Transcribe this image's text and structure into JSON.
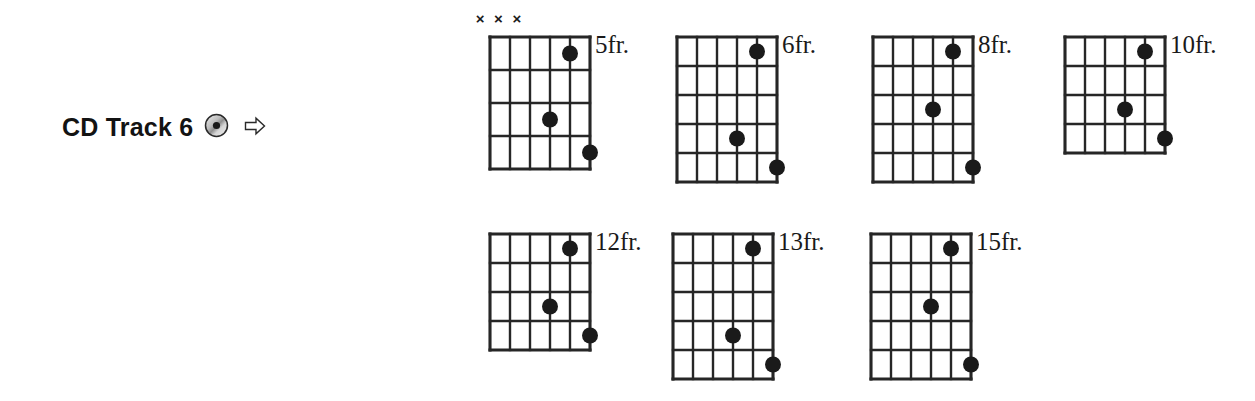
{
  "colors": {
    "ink": "#1a1a1a",
    "grid_line": "#262626",
    "dot": "#1a1a1a",
    "background": "#ffffff"
  },
  "left_block": {
    "label": "CD Track 6",
    "cd_icon_name": "cd-disc-icon",
    "arrow_icon_name": "right-arrow-icon",
    "arrow_glyph": "⇨"
  },
  "chart_data": {
    "type": "table",
    "strings": 6,
    "columns": 5,
    "mute_symbol": "×",
    "diagrams": [
      {
        "id": "chord-5fr",
        "fret_label": "5fr.",
        "frets": 4,
        "x": 481,
        "y": 28,
        "cell_w": 20,
        "cell_h": 33,
        "muted_strings": [
          1,
          2,
          3
        ],
        "dots": [
          {
            "string": 5,
            "fret": 1
          },
          {
            "string": 4,
            "fret": 3
          },
          {
            "string": 6,
            "fret": 4
          }
        ]
      },
      {
        "id": "chord-6fr",
        "fret_label": "6fr.",
        "frets": 5,
        "x": 668,
        "y": 28,
        "cell_w": 20,
        "cell_h": 29,
        "muted_strings": [],
        "dots": [
          {
            "string": 5,
            "fret": 1
          },
          {
            "string": 4,
            "fret": 4
          },
          {
            "string": 6,
            "fret": 5
          }
        ]
      },
      {
        "id": "chord-8fr",
        "fret_label": "8fr.",
        "frets": 5,
        "x": 864,
        "y": 28,
        "cell_w": 20,
        "cell_h": 29,
        "muted_strings": [],
        "dots": [
          {
            "string": 5,
            "fret": 1
          },
          {
            "string": 4,
            "fret": 3
          },
          {
            "string": 6,
            "fret": 5
          }
        ]
      },
      {
        "id": "chord-10fr",
        "fret_label": "10fr.",
        "frets": 4,
        "x": 1056,
        "y": 28,
        "cell_w": 20,
        "cell_h": 29,
        "muted_strings": [],
        "dots": [
          {
            "string": 5,
            "fret": 1
          },
          {
            "string": 4,
            "fret": 3
          },
          {
            "string": 6,
            "fret": 4
          }
        ]
      },
      {
        "id": "chord-12fr",
        "fret_label": "12fr.",
        "frets": 4,
        "x": 481,
        "y": 225,
        "cell_w": 20,
        "cell_h": 29,
        "muted_strings": [],
        "dots": [
          {
            "string": 5,
            "fret": 1
          },
          {
            "string": 4,
            "fret": 3
          },
          {
            "string": 6,
            "fret": 4
          }
        ]
      },
      {
        "id": "chord-13fr",
        "fret_label": "13fr.",
        "frets": 5,
        "x": 664,
        "y": 225,
        "cell_w": 20,
        "cell_h": 29,
        "muted_strings": [],
        "dots": [
          {
            "string": 5,
            "fret": 1
          },
          {
            "string": 4,
            "fret": 4
          },
          {
            "string": 6,
            "fret": 5
          }
        ]
      },
      {
        "id": "chord-15fr",
        "fret_label": "15fr.",
        "frets": 5,
        "x": 862,
        "y": 225,
        "cell_w": 20,
        "cell_h": 29,
        "muted_strings": [],
        "dots": [
          {
            "string": 5,
            "fret": 1
          },
          {
            "string": 4,
            "fret": 3
          },
          {
            "string": 6,
            "fret": 5
          }
        ]
      }
    ]
  }
}
